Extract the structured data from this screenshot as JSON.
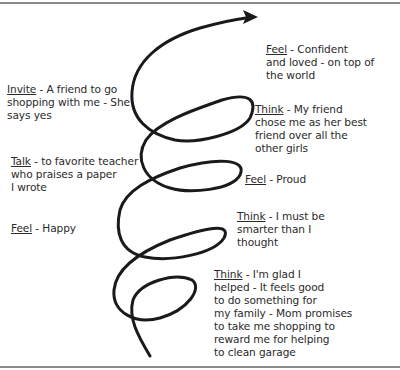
{
  "diagram": {
    "type": "upward spiral",
    "stroke_color": "#1a1a1a",
    "rule_color": "#8a8a8a",
    "labels": [
      {
        "id": "feel-confident",
        "keyword": "Feel",
        "lines": [
          " - Confident",
          "and loved - on top of",
          "the world"
        ]
      },
      {
        "id": "invite",
        "keyword": "Invite",
        "lines": [
          " - A friend to go",
          "shopping with me - She",
          "says yes"
        ]
      },
      {
        "id": "think-friend",
        "keyword": "Think",
        "lines": [
          " - My friend",
          "chose me as her best",
          "friend over all the",
          "other girls"
        ]
      },
      {
        "id": "talk",
        "keyword": "Talk",
        "lines": [
          " - to favorite teacher",
          "who praises a paper",
          "I wrote"
        ]
      },
      {
        "id": "feel-proud",
        "keyword": "Feel",
        "lines": [
          " - Proud"
        ]
      },
      {
        "id": "feel-happy",
        "keyword": "Feel",
        "lines": [
          " - Happy"
        ]
      },
      {
        "id": "think-smarter",
        "keyword": "Think",
        "lines": [
          " - I must be",
          "smarter than I",
          "thought"
        ]
      },
      {
        "id": "think-glad",
        "keyword": "Think",
        "lines": [
          " - I'm glad I",
          "helped - It feels good",
          "to do something for",
          "my family - Mom promises",
          "to take me shopping to",
          "reward me for helping",
          "to clean garage"
        ]
      }
    ]
  }
}
